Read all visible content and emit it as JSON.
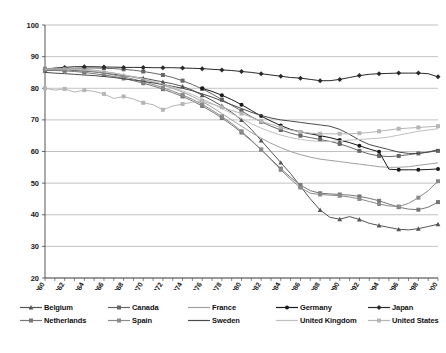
{
  "chart_data": {
    "type": "line",
    "title": "",
    "subtitle": "",
    "xlabel": "",
    "ylabel": "",
    "xlim": [
      1960,
      2000
    ],
    "ylim": [
      20,
      100
    ],
    "yticks": [
      20,
      30,
      40,
      50,
      60,
      70,
      80,
      90,
      100
    ],
    "grid": true,
    "grid_axis": "y",
    "legend_position": "bottom",
    "legend_columns": 5,
    "legend_rows": 2,
    "x": [
      1960,
      1961,
      1962,
      1963,
      1964,
      1965,
      1966,
      1967,
      1968,
      1969,
      1970,
      1971,
      1972,
      1973,
      1974,
      1975,
      1976,
      1977,
      1978,
      1979,
      1980,
      1981,
      1982,
      1983,
      1984,
      1985,
      1986,
      1987,
      1988,
      1989,
      1990,
      1991,
      1992,
      1993,
      1994,
      1995,
      1996,
      1997,
      1998,
      1999,
      2000
    ],
    "xtick_labels": [
      "1960",
      "1962",
      "1964",
      "1966",
      "1968",
      "1970",
      "1972",
      "1974",
      "1976",
      "1978",
      "1980",
      "1982",
      "1984",
      "1986",
      "1988",
      "1990",
      "1992",
      "1994",
      "1996",
      "1998",
      "2000"
    ],
    "series": [
      {
        "name": "Belgium",
        "color": "#555555",
        "marker": "triangle",
        "values": [
          85.5,
          85.8,
          85.9,
          85.6,
          85.4,
          85.2,
          84.8,
          84.4,
          84.0,
          83.6,
          83.2,
          82.6,
          82.0,
          81.4,
          80.6,
          79.4,
          77.8,
          76.2,
          74.4,
          72.4,
          70.0,
          67.0,
          63.5,
          60.0,
          56.5,
          53.0,
          49.0,
          45.0,
          41.5,
          39.2,
          38.6,
          39.4,
          38.5,
          37.3,
          36.6,
          36.0,
          35.4,
          35.2,
          35.6,
          36.3,
          37.0
        ]
      },
      {
        "name": "Canada",
        "color": "#666666",
        "marker": "square",
        "values": [
          85.8,
          86.0,
          86.2,
          86.3,
          86.4,
          86.4,
          86.3,
          86.2,
          86.0,
          85.7,
          85.3,
          84.8,
          84.2,
          83.4,
          82.4,
          81.2,
          79.8,
          78.2,
          76.4,
          74.6,
          72.8,
          71.0,
          69.4,
          68.0,
          66.8,
          65.8,
          65.0,
          64.4,
          63.8,
          63.2,
          62.4,
          61.4,
          60.2,
          59.2,
          58.6,
          58.4,
          58.6,
          59.0,
          59.4,
          59.8,
          60.2
        ]
      },
      {
        "name": "France",
        "color": "#a0a0a0",
        "marker": "none",
        "values": [
          86.0,
          86.2,
          86.3,
          86.2,
          86.0,
          85.7,
          85.3,
          84.8,
          84.2,
          83.5,
          82.8,
          82.0,
          81.0,
          80.0,
          78.8,
          77.4,
          75.8,
          74.0,
          72.0,
          70.0,
          68.0,
          66.0,
          64.2,
          62.6,
          61.2,
          60.0,
          59.0,
          58.2,
          57.6,
          57.2,
          56.8,
          56.4,
          56.0,
          55.6,
          55.2,
          55.0,
          55.0,
          55.2,
          55.6,
          56.0,
          56.4
        ]
      },
      {
        "name": "Germany",
        "color": "#1a1a1a",
        "marker": "circle",
        "values": [
          null,
          null,
          null,
          null,
          null,
          null,
          null,
          null,
          null,
          null,
          null,
          null,
          null,
          null,
          null,
          null,
          80.0,
          79.0,
          77.8,
          76.4,
          74.8,
          73.0,
          71.2,
          69.6,
          68.2,
          67.0,
          66.2,
          65.6,
          65.0,
          64.4,
          63.6,
          62.8,
          61.8,
          60.8,
          59.9,
          54.4,
          54.2,
          54.2,
          54.2,
          54.3,
          54.5
        ]
      },
      {
        "name": "Japan",
        "color": "#2a2a2a",
        "marker": "diamond",
        "values": [
          86.0,
          86.4,
          86.6,
          86.8,
          86.8,
          86.8,
          86.7,
          86.7,
          86.6,
          86.6,
          86.6,
          86.5,
          86.5,
          86.5,
          86.4,
          86.3,
          86.2,
          86.0,
          85.8,
          85.6,
          85.3,
          85.0,
          84.6,
          84.2,
          83.8,
          83.4,
          83.2,
          82.8,
          82.4,
          82.4,
          82.8,
          83.4,
          84.0,
          84.4,
          84.6,
          84.7,
          84.8,
          84.8,
          84.8,
          84.6,
          83.6
        ]
      },
      {
        "name": "Netherlands",
        "color": "#777777",
        "marker": "square",
        "values": [
          85.6,
          85.6,
          85.5,
          85.3,
          85.0,
          84.6,
          84.2,
          83.7,
          83.1,
          82.4,
          81.6,
          80.7,
          79.7,
          78.6,
          77.4,
          76.0,
          74.4,
          72.6,
          70.6,
          68.4,
          66.0,
          63.4,
          60.6,
          57.6,
          54.6,
          51.8,
          49.4,
          47.6,
          46.8,
          46.6,
          46.4,
          46.2,
          45.8,
          45.2,
          44.4,
          43.4,
          42.4,
          41.8,
          41.6,
          42.4,
          44.0
        ]
      },
      {
        "name": "Spain",
        "color": "#8a8a8a",
        "marker": "square",
        "values": [
          86.2,
          86.2,
          86.1,
          85.9,
          85.6,
          85.2,
          84.8,
          84.2,
          83.6,
          82.9,
          82.1,
          81.2,
          80.2,
          79.1,
          77.9,
          76.5,
          74.9,
          73.1,
          71.1,
          68.9,
          66.4,
          63.6,
          60.6,
          57.4,
          54.2,
          51.2,
          48.6,
          46.8,
          46.4,
          46.2,
          46.0,
          45.6,
          45.0,
          44.2,
          43.4,
          42.8,
          42.6,
          43.6,
          45.4,
          47.6,
          50.6
        ]
      },
      {
        "name": "Sweden",
        "color": "#4a4a4a",
        "marker": "none",
        "values": [
          85.0,
          84.8,
          84.6,
          84.4,
          84.2,
          84.0,
          83.7,
          83.4,
          83.0,
          82.6,
          82.2,
          81.7,
          81.2,
          80.6,
          80.0,
          79.2,
          78.2,
          77.2,
          76.0,
          74.8,
          73.6,
          72.4,
          71.4,
          70.6,
          70.0,
          69.6,
          69.2,
          68.8,
          68.4,
          68.0,
          67.0,
          65.4,
          63.6,
          62.2,
          61.4,
          60.6,
          59.8,
          59.4,
          59.4,
          59.8,
          60.6
        ]
      },
      {
        "name": "United Kingdom",
        "color": "#c0c0c0",
        "marker": "none",
        "values": [
          86.0,
          86.1,
          86.1,
          86.0,
          85.8,
          85.5,
          85.2,
          84.8,
          84.3,
          83.7,
          83.0,
          82.2,
          81.3,
          80.3,
          79.2,
          78.0,
          76.6,
          75.2,
          73.6,
          72.0,
          70.4,
          68.8,
          67.4,
          66.2,
          65.2,
          64.4,
          63.8,
          63.4,
          63.2,
          63.2,
          63.4,
          63.6,
          63.8,
          64.0,
          64.2,
          64.6,
          65.2,
          65.8,
          66.4,
          66.8,
          67.2
        ]
      },
      {
        "name": "United States",
        "color": "#b5b5b5",
        "marker": "square",
        "values": [
          80.0,
          79.4,
          79.8,
          78.8,
          79.4,
          79.0,
          78.2,
          76.8,
          77.4,
          76.6,
          75.4,
          74.8,
          73.2,
          74.4,
          75.0,
          75.6,
          76.0,
          75.0,
          74.0,
          73.0,
          72.0,
          70.8,
          69.6,
          68.6,
          67.6,
          66.8,
          66.2,
          65.8,
          65.6,
          65.6,
          65.6,
          65.6,
          65.8,
          66.0,
          66.4,
          66.8,
          67.2,
          67.4,
          67.6,
          67.8,
          68.0
        ]
      }
    ]
  },
  "legend": {
    "row1": [
      {
        "label": "Belgium",
        "series_index": 0
      },
      {
        "label": "Canada",
        "series_index": 1
      },
      {
        "label": "France",
        "series_index": 2
      },
      {
        "label": "Germany",
        "series_index": 3
      },
      {
        "label": "Japan",
        "series_index": 4
      }
    ],
    "row2": [
      {
        "label": "Netherlands",
        "series_index": 5
      },
      {
        "label": "Spain",
        "series_index": 6
      },
      {
        "label": "Sweden",
        "series_index": 7
      },
      {
        "label": "United Kingdom",
        "series_index": 8
      },
      {
        "label": "United States",
        "series_index": 9
      }
    ]
  },
  "axis": {
    "y_top": "100",
    "y_bottom": "20",
    "x_first": "1960",
    "x_last": "2000"
  }
}
